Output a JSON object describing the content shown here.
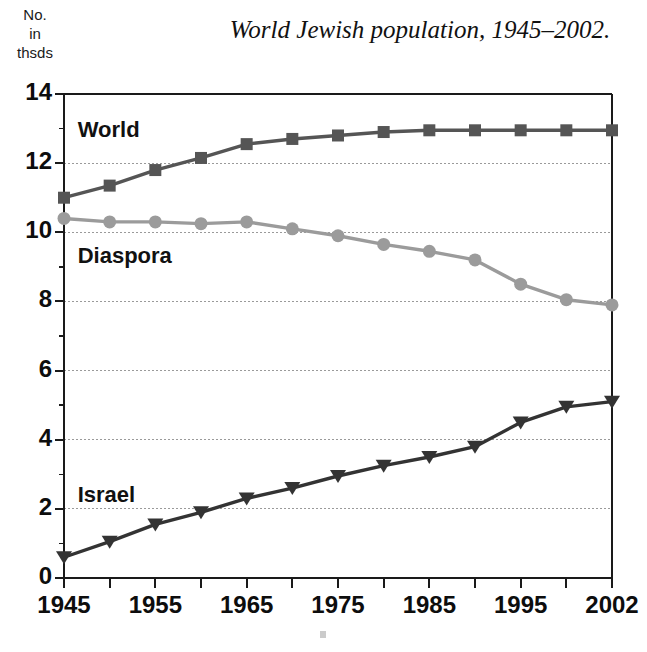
{
  "chart_data": {
    "type": "line",
    "title": "World Jewish population, 1945–2002.",
    "ylabel_lines": [
      "No.",
      "in",
      "thsds"
    ],
    "xlabel": "",
    "x": [
      1945,
      1950,
      1955,
      1960,
      1965,
      1970,
      1975,
      1980,
      1985,
      1990,
      1995,
      2000,
      2002
    ],
    "xtick_labels": [
      "1945",
      "",
      "1955",
      "",
      "1965",
      "",
      "1975",
      "",
      "1985",
      "",
      "1995",
      "",
      "2002"
    ],
    "xtick_labels_shown": [
      "1945",
      "1955",
      "1965",
      "1975",
      "1985",
      "1995",
      "2002"
    ],
    "ytick_labels": [
      "0",
      "2",
      "4",
      "6",
      "8",
      "10",
      "12",
      "14"
    ],
    "ytick_values": [
      0,
      2,
      4,
      6,
      8,
      10,
      12,
      14
    ],
    "yminor_step": 1,
    "ylim": [
      0,
      14
    ],
    "grid": "horizontal-dotted",
    "legend": "inline-labels",
    "series": [
      {
        "name": "World",
        "marker": "square",
        "color": "#555555",
        "label_x": 1946.5,
        "label_y": 12.9,
        "values": [
          11.0,
          11.35,
          11.8,
          12.15,
          12.55,
          12.7,
          12.8,
          12.9,
          12.95,
          12.95,
          12.95,
          12.95,
          12.95
        ]
      },
      {
        "name": "Diaspora",
        "marker": "circle",
        "color": "#9b9b9b",
        "label_x": 1946.5,
        "label_y": 9.25,
        "values": [
          10.4,
          10.3,
          10.3,
          10.25,
          10.3,
          10.1,
          9.9,
          9.65,
          9.45,
          9.2,
          8.5,
          8.05,
          7.9
        ]
      },
      {
        "name": "Israel",
        "marker": "triangle-down",
        "color": "#333333",
        "label_x": 1946.5,
        "label_y": 2.35,
        "values": [
          0.6,
          1.05,
          1.55,
          1.9,
          2.3,
          2.6,
          2.95,
          3.25,
          3.5,
          3.8,
          4.5,
          4.95,
          5.1
        ]
      }
    ]
  },
  "colors": {
    "axis": "#1a1a1a",
    "grid": "#9a9a9a",
    "world": "#555555",
    "diaspora": "#9b9b9b",
    "israel": "#333333",
    "background": "#ffffff"
  }
}
